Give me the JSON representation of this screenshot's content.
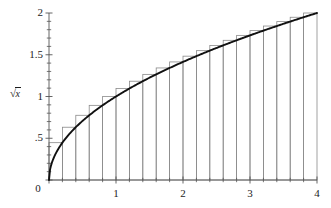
{
  "figure": {
    "background_color": "#ffffff",
    "curve_color": "#111111",
    "rect_color": "#8a8a8a",
    "axis_color": "#555555",
    "text_color": "#1c1c1c"
  },
  "axes": {
    "y_axis_label": "√x",
    "y_axis_label_radical": "√",
    "y_axis_label_radicand": "x",
    "x_tick_labels": [
      "0",
      "1",
      "2",
      "3",
      "4"
    ],
    "y_tick_labels": [
      "0",
      ".5",
      "1",
      "1.5",
      "2"
    ]
  },
  "chart_data": {
    "type": "line",
    "title": "",
    "xlabel": "",
    "ylabel": "√x",
    "xlim": [
      0,
      4
    ],
    "ylim": [
      0,
      2
    ],
    "grid": false,
    "legend": false,
    "x_ticks_major": [
      0,
      1,
      2,
      3,
      4
    ],
    "x_ticks_minor": [
      0.2,
      0.4,
      0.6,
      0.8,
      1.2,
      1.4,
      1.6,
      1.8,
      2.2,
      2.4,
      2.6,
      2.8,
      3.2,
      3.4,
      3.6,
      3.8
    ],
    "y_ticks_major": [
      0,
      0.5,
      1,
      1.5,
      2
    ],
    "y_ticks_minor": [
      0.1,
      0.2,
      0.3,
      0.4,
      0.6,
      0.7,
      0.8,
      0.9,
      1.1,
      1.2,
      1.3,
      1.4,
      1.6,
      1.7,
      1.8,
      1.9
    ],
    "series": [
      {
        "name": "√x",
        "kind": "curve",
        "function": "sqrt(x)",
        "x": [
          0,
          0.05,
          0.1,
          0.15,
          0.2,
          0.3,
          0.4,
          0.5,
          0.6,
          0.8,
          1.0,
          1.2,
          1.4,
          1.6,
          1.8,
          2.0,
          2.2,
          2.4,
          2.6,
          2.8,
          3.0,
          3.2,
          3.4,
          3.6,
          3.8,
          4.0
        ],
        "y": [
          0,
          0.224,
          0.316,
          0.387,
          0.447,
          0.548,
          0.632,
          0.707,
          0.775,
          0.894,
          1.0,
          1.095,
          1.183,
          1.265,
          1.342,
          1.414,
          1.483,
          1.549,
          1.612,
          1.673,
          1.732,
          1.789,
          1.844,
          1.897,
          1.949,
          2.0
        ]
      },
      {
        "name": "circumscribed rectangles (right endpoint Riemann sum)",
        "kind": "rectangles",
        "n": 20,
        "width": 0.2,
        "x_left": [
          0,
          0.2,
          0.4,
          0.6,
          0.8,
          1.0,
          1.2,
          1.4,
          1.6,
          1.8,
          2.0,
          2.2,
          2.4,
          2.6,
          2.8,
          3.0,
          3.2,
          3.4,
          3.6,
          3.8
        ],
        "x_right": [
          0.2,
          0.4,
          0.6,
          0.8,
          1.0,
          1.2,
          1.4,
          1.6,
          1.8,
          2.0,
          2.2,
          2.4,
          2.6,
          2.8,
          3.0,
          3.2,
          3.4,
          3.6,
          3.8,
          4.0
        ],
        "heights": [
          0.447,
          0.632,
          0.775,
          0.894,
          1.0,
          1.095,
          1.183,
          1.265,
          1.342,
          1.414,
          1.483,
          1.549,
          1.612,
          1.673,
          1.732,
          1.789,
          1.844,
          1.897,
          1.949,
          2.0
        ]
      }
    ]
  }
}
